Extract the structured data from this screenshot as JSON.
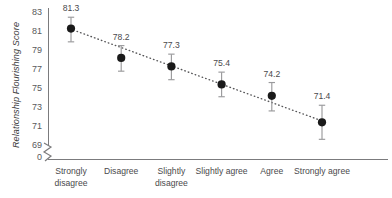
{
  "chart_data": {
    "type": "scatter",
    "title": "",
    "xlabel": "",
    "ylabel": "Relationship Flourishing Score",
    "categories": [
      "Strongly\ndisagree",
      "Disagree",
      "Slightly\ndisagree",
      "Slightly agree",
      "Agree",
      "Strongly agree"
    ],
    "values": [
      81.3,
      78.2,
      77.3,
      75.4,
      74.2,
      71.4
    ],
    "data_labels": [
      "81.3",
      "78.2",
      "77.3",
      "75.4",
      "74.2",
      "71.4"
    ],
    "error_bars": {
      "lower": [
        79.9,
        76.8,
        75.9,
        74.1,
        72.6,
        69.6
      ],
      "upper": [
        82.5,
        79.5,
        78.6,
        76.7,
        75.6,
        73.2
      ]
    },
    "yticks": [
      83,
      81,
      79,
      77,
      75,
      73,
      71,
      69,
      0
    ],
    "ytick_labels": [
      "83",
      "81",
      "79",
      "77",
      "75",
      "73",
      "71",
      "69",
      "0"
    ],
    "ylim": [
      69,
      83
    ],
    "y_axis_break": true,
    "grid": false,
    "legend": "none",
    "trendline": {
      "type": "linear-dotted",
      "start_value": 81.0,
      "end_value": 71.7
    },
    "marker_color": "#1a1a1a",
    "errorbar_color": "#9a9a9c",
    "trendline_color": "#555557",
    "axis_color": "#7b7b7d",
    "text_color": "#4a4a4c"
  }
}
